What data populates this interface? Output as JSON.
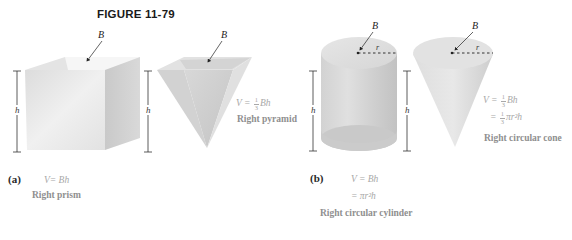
{
  "figure": {
    "title": "FIGURE 11-79"
  },
  "panel_a": {
    "part_label": "(a)",
    "prism": {
      "base_label": "B",
      "height_label": "h",
      "formula": "V= Bh",
      "name": "Right prism"
    },
    "pyramid": {
      "base_label": "B",
      "height_label": "h",
      "formula_prefix": "V =",
      "formula_frac_num": "1",
      "formula_frac_den": "3",
      "formula_suffix": "Bh",
      "name": "Right pyramid"
    }
  },
  "panel_b": {
    "part_label": "(b)",
    "cylinder": {
      "base_label": "B",
      "radius_label": "r",
      "height_label": "h",
      "formula_line1": "V = Bh",
      "formula_line2": "= πr²h",
      "name": "Right circular cylinder"
    },
    "cone": {
      "base_label": "B",
      "radius_label": "r",
      "formula_line1_prefix": "V =",
      "formula_line1_frac_num": "1",
      "formula_line1_frac_den": "3",
      "formula_line1_suffix": "Bh",
      "formula_line2_prefix": "=",
      "formula_line2_frac_num": "1",
      "formula_line2_frac_den": "3",
      "formula_line2_suffix": "πr²h",
      "name": "Right circular cone"
    }
  },
  "colors": {
    "solid_light": "#ececec",
    "solid_mid": "#d6d6d6",
    "solid_dark": "#bdbdbd",
    "formula_text": "#a8a8a8",
    "name_text": "#8f8f8f",
    "title_text": "#1a1a1a"
  }
}
